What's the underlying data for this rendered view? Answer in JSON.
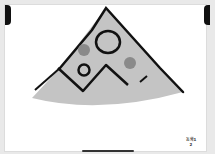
{
  "app": {
    "screen": "drawing-canvas"
  },
  "drawing": {
    "subject": "pizza-slice",
    "fill_color": "#c4c4c4",
    "outline_color": "#111111",
    "topping_color": "#8a8a8a"
  },
  "page_label": {
    "line1": "동화1",
    "line2": "2"
  },
  "colors": {
    "background": "#e9e9e9",
    "canvas": "#ffffff"
  }
}
